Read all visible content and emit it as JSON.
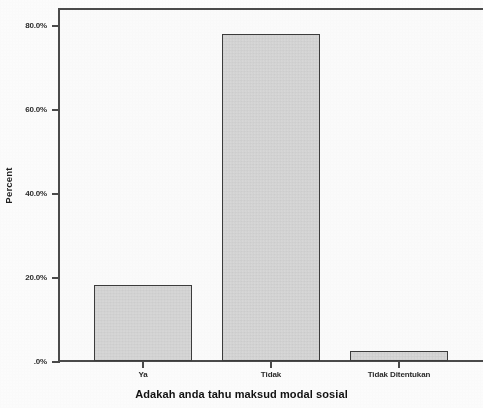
{
  "chart_data": {
    "type": "bar",
    "title": "",
    "subtitle": "",
    "xlabel": "Adakah anda tahu maksud modal sosial",
    "ylabel": "Percent",
    "categories": [
      "Ya",
      "Tidak",
      "Tidak Ditentukan"
    ],
    "values": [
      18.1,
      77.9,
      2.4
    ],
    "series": [
      {
        "name": "Percent",
        "values": [
          18.1,
          77.9,
          2.4
        ]
      }
    ],
    "ylim": [
      0,
      84
    ],
    "yticks": [
      0,
      20,
      40,
      60,
      80
    ],
    "ytick_labels": [
      ".0%",
      "20.0%",
      "40.0%",
      "60.0%",
      "80.0%"
    ],
    "grid": false,
    "legend": null,
    "legend_position": "none",
    "bar_fill_color": "#d9d9d9",
    "bar_border_color": "#3c3c3c",
    "axis_color": "#4a4a4a",
    "text_color": "#1f1f1f"
  },
  "axes": {
    "y": {
      "title": "Percent",
      "ticks": [
        {
          "label": "80.0%",
          "value": 80
        },
        {
          "label": "60.0%",
          "value": 60
        },
        {
          "label": "40.0%",
          "value": 40
        },
        {
          "label": "20.0%",
          "value": 20
        },
        {
          "label": ".0%",
          "value": 0
        }
      ]
    },
    "x": {
      "title": "Adakah anda tahu maksud modal sosial",
      "ticks": [
        {
          "label": "Ya"
        },
        {
          "label": "Tidak"
        },
        {
          "label": "Tidak Ditentukan"
        }
      ]
    }
  }
}
